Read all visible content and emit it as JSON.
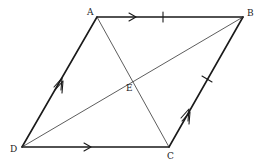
{
  "figure": {
    "type": "parallelogram",
    "vertices": {
      "A": {
        "label": "A",
        "x": 97,
        "y": 17
      },
      "B": {
        "label": "B",
        "x": 243,
        "y": 17
      },
      "C": {
        "label": "C",
        "x": 169,
        "y": 147
      },
      "D": {
        "label": "D",
        "x": 22,
        "y": 147
      }
    },
    "intersection": {
      "label": "E",
      "x": 132,
      "y": 80
    },
    "sides": [
      {
        "from": "A",
        "to": "B",
        "arrow": "single",
        "tick": true
      },
      {
        "from": "D",
        "to": "C",
        "arrow": "single",
        "tick": false
      },
      {
        "from": "D",
        "to": "A",
        "arrow": "double",
        "tick": false
      },
      {
        "from": "C",
        "to": "B",
        "arrow": "double",
        "tick": true
      }
    ],
    "diagonals": [
      {
        "from": "A",
        "to": "C"
      },
      {
        "from": "D",
        "to": "B"
      }
    ],
    "colors": {
      "line": "#1a1a1a",
      "background": "#ffffff"
    }
  }
}
